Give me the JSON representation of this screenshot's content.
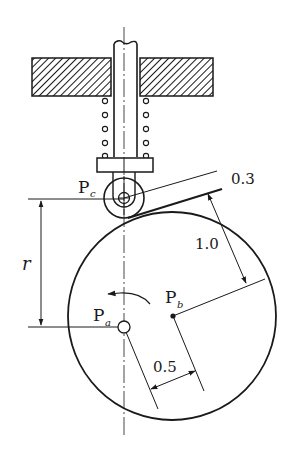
{
  "diagram": {
    "type": "cam-follower mechanism",
    "labels": {
      "pc_main": "P",
      "pc_sub": "c",
      "pa_main": "P",
      "pa_sub": "a",
      "pb_main": "P",
      "pb_sub": "b",
      "radius": "r",
      "dim_offset": "0.3",
      "dim_distance": "1.0",
      "dim_eccentric": "0.5"
    },
    "components": [
      "follower-rod",
      "fixed-guide-hatched",
      "compression-spring",
      "follower-flange",
      "roller",
      "eccentric-circular-cam",
      "rotation-arrow",
      "centerline"
    ],
    "colors": {
      "stroke": "#1a1a1a",
      "background": "#ffffff"
    }
  }
}
